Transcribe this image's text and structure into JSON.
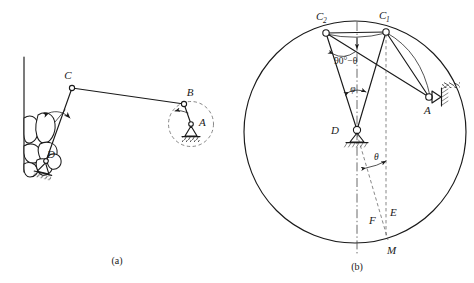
{
  "figure": {
    "captions": {
      "a": "(a)",
      "b": "(b)"
    }
  },
  "diagram_a": {
    "name": "mechanism-schematic",
    "labels": {
      "A": "A",
      "B": "B",
      "C": "C",
      "D": "D"
    },
    "elements": {
      "wall": "vertical-wall",
      "material": "crushed-material",
      "crank_circle": "crank-path-dashed-circle",
      "oscillation_arrow": "double-arrow-oscillation",
      "ground_support_A": "fixed-pivot-A",
      "ground_support_D": "fixed-pivot-D",
      "coupler": "link-BC",
      "rocker": "link-CD",
      "crank": "link-AB"
    }
  },
  "diagram_b": {
    "name": "limiting-position-construction",
    "labels": {
      "C1": "C",
      "C1_sub": "1",
      "C2": "C",
      "C2_sub": "2",
      "A": "A",
      "D": "D",
      "E": "E",
      "F": "F",
      "M": "M"
    },
    "angles": {
      "phi": "φ",
      "theta": "θ",
      "ninety_minus_theta": "90°−θ"
    },
    "elements": {
      "circumcircle": "construction-circle",
      "chord_C2C1": "chord-C2-C1",
      "ray_D_C1": "line-D-C1",
      "ray_D_C2": "line-D-C2",
      "ray_C1_A": "line-C1-A",
      "ray_C2_A": "line-C2-A",
      "arc_C1_A": "arc-C1-A",
      "centerline": "vertical-centerline-dashdot",
      "dashed_vertical_E": "dashed-vertical-through-C1",
      "dashed_ray_F": "dashed-ray-D-M",
      "pivot_A": "fixed-pivot-A",
      "pivot_D": "fixed-pivot-D"
    }
  },
  "colors": {
    "ink": "#1a1a1a",
    "dashed": "#555555",
    "background": "#ffffff"
  }
}
